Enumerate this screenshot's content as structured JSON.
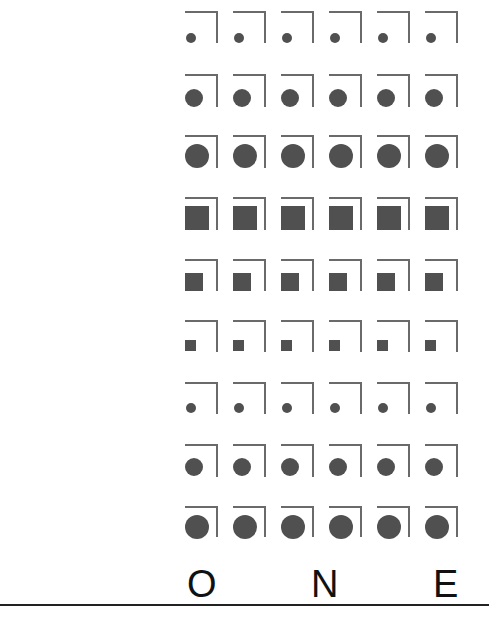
{
  "grid": {
    "columns": 6,
    "column_x": [
      185,
      233,
      281,
      329,
      377,
      425
    ],
    "bracket_color": "#6a6a6a",
    "mark_color": "#505050",
    "rows": [
      {
        "shape": "circle",
        "size": "small",
        "top": 11,
        "bracket_height": 32,
        "mark_size": 10,
        "mark_offset_x": 1,
        "mark_offset_y": 22
      },
      {
        "shape": "circle",
        "size": "medium",
        "top": 74,
        "bracket_height": 33,
        "mark_size": 18,
        "mark_offset_x": 0,
        "mark_offset_y": 15
      },
      {
        "shape": "circle",
        "size": "large",
        "top": 135,
        "bracket_height": 33,
        "mark_size": 24,
        "mark_offset_x": 0,
        "mark_offset_y": 9
      },
      {
        "shape": "square",
        "size": "large",
        "top": 197,
        "bracket_height": 33,
        "mark_size": 24,
        "mark_offset_x": 0,
        "mark_offset_y": 9
      },
      {
        "shape": "square",
        "size": "medium",
        "top": 259,
        "bracket_height": 32,
        "mark_size": 18,
        "mark_offset_x": 0,
        "mark_offset_y": 14
      },
      {
        "shape": "square",
        "size": "small",
        "top": 320,
        "bracket_height": 32,
        "mark_size": 11,
        "mark_offset_x": 0,
        "mark_offset_y": 20
      },
      {
        "shape": "circle",
        "size": "small",
        "top": 382,
        "bracket_height": 32,
        "mark_size": 10,
        "mark_offset_x": 1,
        "mark_offset_y": 21
      },
      {
        "shape": "circle",
        "size": "medium",
        "top": 444,
        "bracket_height": 33,
        "mark_size": 18,
        "mark_offset_x": 0,
        "mark_offset_y": 14
      },
      {
        "shape": "circle",
        "size": "large",
        "top": 506,
        "bracket_height": 31,
        "mark_size": 24,
        "mark_offset_x": 0,
        "mark_offset_y": 9
      }
    ]
  },
  "title": {
    "letters": [
      {
        "char": "O",
        "x": 187
      },
      {
        "char": "N",
        "x": 311
      },
      {
        "char": "E",
        "x": 433
      }
    ],
    "text_color": "#111111"
  },
  "rule": {
    "color": "#222222"
  }
}
